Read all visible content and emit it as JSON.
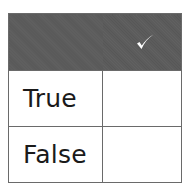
{
  "table": {
    "header": {
      "label_column": "",
      "check_column_icon": "checkmark-icon"
    },
    "rows": [
      {
        "label": "True",
        "checked": ""
      },
      {
        "label": "False",
        "checked": ""
      }
    ]
  },
  "colors": {
    "header_bg": "#5b5b5b",
    "grid_line": "#6a6a6a",
    "text": "#1a1a1a",
    "checkmark": "#ffffff"
  }
}
